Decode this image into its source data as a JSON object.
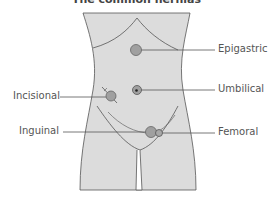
{
  "title": "The common hernias",
  "labels": {
    "epigastric": "Epigastric",
    "umbilical": "Umbilical",
    "incisional": "Incisional",
    "inguinal": "Inguinal",
    "femoral": "Femoral"
  },
  "colors": {
    "body_fill": "#dcdcdc",
    "outline": "#555555",
    "hernia_fill": "#a0a0a0",
    "hernia_stroke": "#666666",
    "text": "#555555"
  }
}
